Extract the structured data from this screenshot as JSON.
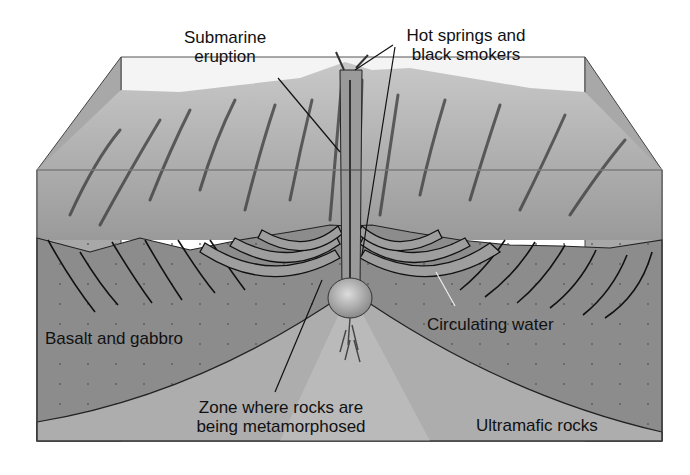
{
  "diagram": {
    "labels": {
      "submarine_eruption": [
        "Submarine",
        "eruption"
      ],
      "hot_springs": [
        "Hot springs and",
        "black smokers"
      ],
      "basalt_gabbro": "Basalt and gabbro",
      "circulating_water": "Circulating water",
      "metamorphic_zone": [
        "Zone where rocks are",
        "being metamorphosed"
      ],
      "ultramafic": "Ultramafic rocks"
    },
    "colors": {
      "water": "#f4f4f4",
      "seafloor": "#b5b5b5",
      "side_face": "#a8a8a8",
      "basalt_layer": "#8c8c8c",
      "ultramafic_layer": "#adadad",
      "metamorphic_zone": "#bdbdbd",
      "circulation_arrows": "#9e9e9e",
      "magma": "#b8b8b8",
      "outline": "#222222"
    }
  }
}
